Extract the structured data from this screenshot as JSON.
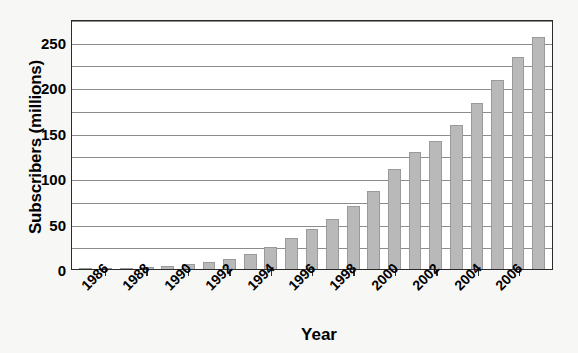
{
  "chart_data": {
    "type": "bar",
    "title": "",
    "xlabel": "Year",
    "ylabel": "Subscribers (millions)",
    "ylim": [
      0,
      275
    ],
    "ytick_values": [
      0,
      50,
      100,
      150,
      200,
      250
    ],
    "ytick_labels": [
      "0",
      "50",
      "100",
      "150",
      "200",
      "250"
    ],
    "minor_gridline_values": [
      25,
      75,
      125,
      175,
      225,
      275
    ],
    "grid": true,
    "legend": null,
    "bar_color": "#b9b9b9",
    "bar_edge_color": "#9a9a9a",
    "plot_background": "#ffffff",
    "figure_background": "#f7f7f5",
    "axis_color": "#2b2b2b",
    "gridline_color": "#8c8c8c",
    "categories": [
      "1985",
      "1986",
      "1987",
      "1988",
      "1989",
      "1990",
      "1991",
      "1992",
      "1993",
      "1994",
      "1995",
      "1996",
      "1997",
      "1998",
      "1999",
      "2000",
      "2001",
      "2002",
      "2003",
      "2004",
      "2005",
      "2006",
      "2007"
    ],
    "values": [
      0.3,
      0.7,
      1.2,
      2.1,
      3.5,
      5.3,
      7.6,
      11.0,
      16.0,
      24.1,
      33.8,
      44.0,
      55.3,
      69.2,
      86.0,
      109.5,
      128.4,
      140.8,
      158.7,
      182.1,
      207.9,
      233.0,
      255.4
    ],
    "xtick_labels": [
      "1986",
      "1988",
      "1990",
      "1992",
      "1994",
      "1996",
      "1998",
      "2000",
      "2002",
      "2004",
      "2006"
    ],
    "xtick_category_indices": [
      1,
      3,
      5,
      7,
      9,
      11,
      13,
      15,
      17,
      19,
      21
    ],
    "xtick_label_rotation": -45
  }
}
